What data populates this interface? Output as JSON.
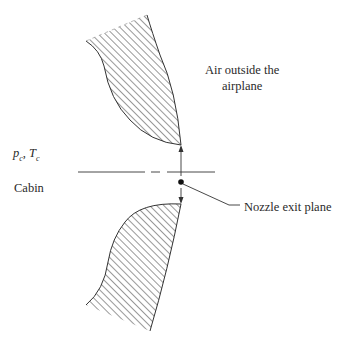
{
  "figure": {
    "type": "schematic",
    "labels": {
      "outside_air_line1": "Air outside the",
      "outside_air_line2": "airplane",
      "cabin_conditions": "p_c, T_c",
      "cabin_conditions_main1": "p",
      "cabin_conditions_sub1": "c",
      "cabin_conditions_sep": ", ",
      "cabin_conditions_main2": "T",
      "cabin_conditions_sub2": "c",
      "cabin": "Cabin",
      "nozzle_exit_plane": "Nozzle exit plane"
    },
    "colors": {
      "ink": "#2a2a2a",
      "background": "#ffffff"
    }
  }
}
